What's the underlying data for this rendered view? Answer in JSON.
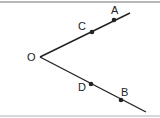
{
  "diagram": {
    "vertex": {
      "label": "O",
      "x": 40,
      "y": 57
    },
    "rays": [
      {
        "name": "upper-ray",
        "end": {
          "x": 130,
          "y": 13
        },
        "points": [
          {
            "label": "C",
            "x": 92,
            "y": 32,
            "lx": 78,
            "ly": 30
          },
          {
            "label": "A",
            "x": 114,
            "y": 20,
            "lx": 111,
            "ly": 14
          }
        ]
      },
      {
        "name": "lower-ray",
        "end": {
          "x": 146,
          "y": 112
        },
        "points": [
          {
            "label": "D",
            "x": 91,
            "y": 84,
            "lx": 78,
            "ly": 91
          },
          {
            "label": "B",
            "x": 121,
            "y": 100,
            "lx": 121,
            "ly": 96
          }
        ]
      }
    ],
    "line_color": "#222222"
  }
}
